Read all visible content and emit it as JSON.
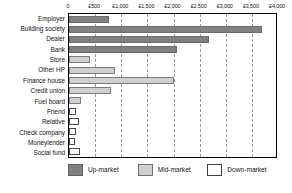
{
  "chart_data": {
    "type": "bar",
    "orientation": "horizontal",
    "title": "",
    "xlabel": "",
    "ylabel": "",
    "xlim": [
      0,
      4000
    ],
    "grid": true,
    "grid_style": "dashed vertical",
    "legend_position": "bottom",
    "currency_symbol": "£",
    "x_ticks": [
      0,
      500,
      1000,
      1500,
      2000,
      2500,
      3000,
      3500,
      4000
    ],
    "x_tick_labels": [
      "0",
      "£500",
      "£1,000",
      "£1,500",
      "£2,000",
      "£2,500",
      "£3,000",
      "£3,500",
      "£4,000"
    ],
    "categories": [
      "Employer",
      "Building society",
      "Dealer",
      "Bank",
      "Store",
      "Other HP",
      "Finance house",
      "Credit union",
      "Fuel board",
      "Friend",
      "Relative",
      "Check company",
      "Moneylender",
      "Social fund"
    ],
    "values": [
      760,
      3700,
      2670,
      2060,
      400,
      880,
      2000,
      800,
      230,
      130,
      200,
      140,
      120,
      210
    ],
    "segment_classes": [
      "up",
      "up",
      "up",
      "up",
      "mid",
      "mid",
      "mid",
      "mid",
      "mid",
      "down",
      "down",
      "down",
      "down",
      "down"
    ],
    "series": [
      {
        "name": "Up-market",
        "class": "up",
        "color": "#808080",
        "points": [
          {
            "category": "Employer",
            "value": 760
          },
          {
            "category": "Building society",
            "value": 3700
          },
          {
            "category": "Dealer",
            "value": 2670
          },
          {
            "category": "Bank",
            "value": 2060
          }
        ]
      },
      {
        "name": "Mid-market",
        "class": "mid",
        "color": "#d0d0d0",
        "points": [
          {
            "category": "Store",
            "value": 400
          },
          {
            "category": "Other HP",
            "value": 880
          },
          {
            "category": "Finance house",
            "value": 2000
          },
          {
            "category": "Credit union",
            "value": 800
          },
          {
            "category": "Fuel board",
            "value": 230
          }
        ]
      },
      {
        "name": "Down-market",
        "class": "down",
        "color": "#ffffff",
        "points": [
          {
            "category": "Friend",
            "value": 130
          },
          {
            "category": "Relative",
            "value": 200
          },
          {
            "category": "Check company",
            "value": 140
          },
          {
            "category": "Moneylender",
            "value": 120
          },
          {
            "category": "Social fund",
            "value": 210
          }
        ]
      }
    ],
    "legend": [
      {
        "label": "Up-market",
        "class": "up",
        "color": "#808080"
      },
      {
        "label": "Mid-market",
        "class": "mid",
        "color": "#d0d0d0"
      },
      {
        "label": "Down-market",
        "class": "down",
        "color": "#ffffff"
      }
    ]
  },
  "caption": ""
}
